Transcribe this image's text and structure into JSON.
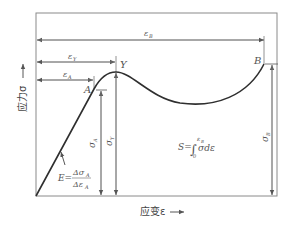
{
  "diagram": {
    "type": "stress-strain-curve",
    "axes": {
      "y_label": "应力σ",
      "x_label": "应变ε"
    },
    "points": {
      "A": "A",
      "Y": "Y",
      "B": "B"
    },
    "strain_dimensions": {
      "eps_B": "ε",
      "eps_B_sub": "B",
      "eps_Y": "ε",
      "eps_Y_sub": "Y",
      "eps_A": "ε",
      "eps_A_sub": "A"
    },
    "stress_dimensions": {
      "sigma_A": "σ",
      "sigma_A_sub": "A",
      "sigma_Y": "σ",
      "sigma_Y_sub": "Y",
      "sigma_B": "σ",
      "sigma_B_sub": "B"
    },
    "formulas": {
      "modulus_lhs": "E=",
      "modulus_num": "Δσ",
      "modulus_num_sub": "A",
      "modulus_den": "Δε",
      "modulus_den_sub": "A",
      "energy_lhs": "S=",
      "energy_integral": "∫",
      "energy_upper": "ε",
      "energy_upper_sub": "B",
      "energy_lower": "0",
      "energy_integrand": "σdε"
    },
    "colors": {
      "frame": "#8a8a8a",
      "curve": "#333333",
      "arrows": "#666666"
    }
  }
}
